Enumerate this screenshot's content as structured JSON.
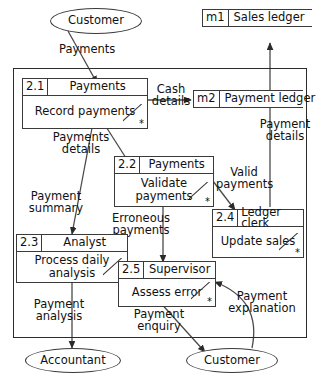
{
  "diagram": {
    "type": "data-flow-diagram"
  },
  "entities": [
    {
      "id": "customer-top",
      "label": "Customer"
    },
    {
      "id": "accountant",
      "label": "Accountant"
    },
    {
      "id": "customer-bottom",
      "label": "Customer"
    }
  ],
  "stores": [
    {
      "id": "m1",
      "code": "m1",
      "label": "Sales ledger"
    },
    {
      "id": "m2",
      "code": "m2",
      "label": "Payment ledger"
    }
  ],
  "processes": [
    {
      "id": "p21",
      "number": "2.1",
      "owner": "Payments",
      "action": "Record payments",
      "marker": "*"
    },
    {
      "id": "p22",
      "number": "2.2",
      "owner": "Payments",
      "action": "Validate payments",
      "marker": "*"
    },
    {
      "id": "p23",
      "number": "2.3",
      "owner": "Analyst",
      "action": "Process daily analysis",
      "marker": "*"
    },
    {
      "id": "p24",
      "number": "2.4",
      "owner": "Ledger clerk",
      "action": "Update sales",
      "marker": "*"
    },
    {
      "id": "p25",
      "number": "2.5",
      "owner": "Supervisor",
      "action": "Assess error",
      "marker": "*"
    }
  ],
  "flows": [
    {
      "id": "f-payments",
      "label": "Payments",
      "from": "customer-top",
      "to": "p21"
    },
    {
      "id": "f-cash-details",
      "label": "Cash details",
      "from": "p21",
      "to": "m2"
    },
    {
      "id": "f-payments-details",
      "label": "Payments details",
      "from": "p21",
      "to": "p22"
    },
    {
      "id": "f-payment-summary",
      "label": "Payment summary",
      "from": "p21",
      "to": "p23"
    },
    {
      "id": "f-valid-payments",
      "label": "Valid payments",
      "from": "p22",
      "to": "p24"
    },
    {
      "id": "f-erroneous-payments",
      "label": "Erroneous payments",
      "from": "p22",
      "to": "p25"
    },
    {
      "id": "f-payment-details",
      "label": "Payment details",
      "from": "p24",
      "to": "m1"
    },
    {
      "id": "f-payment-analysis",
      "label": "Payment analysis",
      "from": "p23",
      "to": "accountant"
    },
    {
      "id": "f-payment-enquiry",
      "label": "Payment enquiry",
      "from": "p25",
      "to": "customer-bottom"
    },
    {
      "id": "f-payment-explanation",
      "label": "Payment explanation",
      "from": "customer-bottom",
      "to": "p25"
    }
  ],
  "colors": {
    "line": "#3a3a3a",
    "boundary": "#2b2b2b",
    "text": "#111111",
    "background": "#ffffff"
  }
}
